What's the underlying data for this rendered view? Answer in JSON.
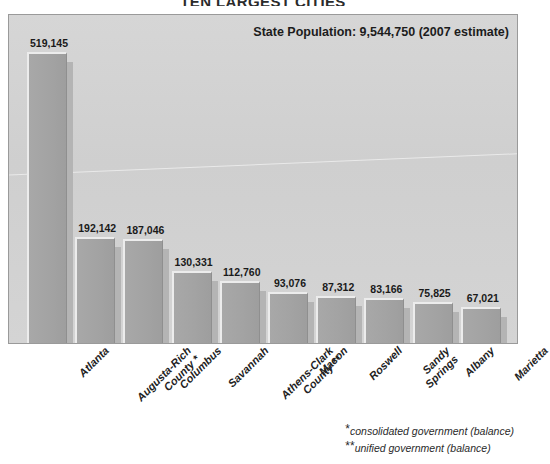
{
  "chart_title": "TEN LARGEST CITIES",
  "state_population_note": "State Population: 9,544,750 (2007 estimate)",
  "footnotes": [
    {
      "mark": "*",
      "text": "consolidated government (balance)"
    },
    {
      "mark": "**",
      "text": "unified government (balance)"
    }
  ],
  "chart_data": {
    "type": "bar",
    "title": "TEN LARGEST CITIES",
    "xlabel": "",
    "ylabel": "",
    "ylim": [
      0,
      560000
    ],
    "grid": false,
    "legend": "none",
    "orientation": "vertical",
    "annotations": [
      "State Population: 9,544,750 (2007 estimate)",
      "* consolidated government (balance)",
      "** unified government (balance)"
    ],
    "categories": [
      "Atlanta",
      "Augusta-Richmond County *",
      "Columbus",
      "Savannah",
      "Athens-Clarke County **",
      "Macon",
      "Roswell",
      "Sandy Springs",
      "Albany",
      "Marietta"
    ],
    "category_lines": [
      [
        "Atlanta"
      ],
      [
        "Augusta-Rich",
        "County *"
      ],
      [
        "Columbus"
      ],
      [
        "Savannah"
      ],
      [
        "Athens-Clark",
        "County **"
      ],
      [
        "Macon"
      ],
      [
        "Roswell"
      ],
      [
        "Sandy",
        "Springs"
      ],
      [
        "Albany"
      ],
      [
        "Marietta"
      ]
    ],
    "values": [
      519145,
      192142,
      187046,
      130331,
      112760,
      93076,
      87312,
      83166,
      75825,
      67021
    ],
    "value_labels": [
      "519,145",
      "192,142",
      "187,046",
      "130,331",
      "112,760",
      "93,076",
      "87,312",
      "83,166",
      "75,825",
      "67,021"
    ]
  },
  "colors": {
    "bar_fill": "#a3a3a3",
    "bar_highlight": "#ececec",
    "bar_shadow": "#b4b4b4",
    "plot_background": "#d2d2d2",
    "frame_border": "#9a9a9a",
    "text": "#1a1a1a"
  }
}
